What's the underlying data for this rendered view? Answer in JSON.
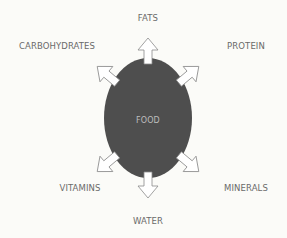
{
  "diagram": {
    "center": {
      "label": "FOOD",
      "fill": "#4e4e4e"
    },
    "nodes": [
      {
        "id": "fats",
        "label": "FATS",
        "direction": "up"
      },
      {
        "id": "protein",
        "label": "PROTEIN",
        "direction": "up-right"
      },
      {
        "id": "minerals",
        "label": "MINERALS",
        "direction": "down-right"
      },
      {
        "id": "water",
        "label": "WATER",
        "direction": "down"
      },
      {
        "id": "vitamins",
        "label": "VITAMINS",
        "direction": "down-left"
      },
      {
        "id": "carbohydrates",
        "label": "CARBOHYDRATES",
        "direction": "up-left"
      }
    ],
    "colors": {
      "background": "#fbfbf8",
      "circle": "#4e4e4e",
      "arrow_fill": "#ffffff",
      "arrow_stroke": "#8a8a8a",
      "text": "#6a6a6a"
    }
  }
}
